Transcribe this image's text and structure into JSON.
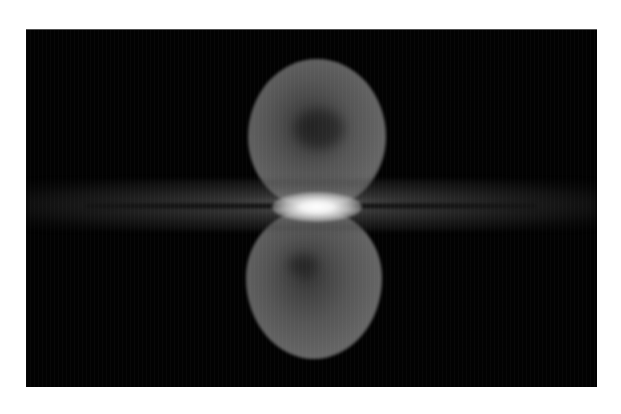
{
  "image": {
    "subject": "Fermi bubbles above and below the Milky Way galactic plane",
    "style": "grayscale astronomical image",
    "features": {
      "north_bubble": "large faint gray lobe above the galactic center",
      "south_bubble": "large faint gray lobe below the galactic center",
      "galactic_plane": "horizontal band of stars and dust across the full width",
      "galactic_center": "bright white core at the center of the plane"
    },
    "background_color": "#020202",
    "page_background": "#ffffff"
  },
  "clipped_header_text": ""
}
